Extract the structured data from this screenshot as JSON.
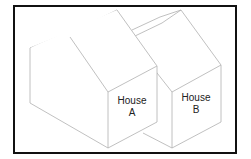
{
  "diagram": {
    "title": "",
    "houses": [
      {
        "name": "House A",
        "line1": "House",
        "line2": "A"
      },
      {
        "name": "House B",
        "line1": "House",
        "line2": "B"
      }
    ],
    "colors": {
      "frame": "#111111",
      "edges": "#b8b8b8",
      "text": "#222222"
    }
  }
}
